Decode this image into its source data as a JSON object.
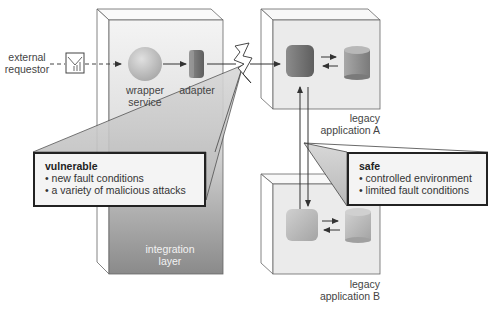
{
  "diagram": {
    "external_requestor": "external\nrequestor",
    "external_requestor_lines": [
      "external",
      "requestor"
    ],
    "wrapper_service_lines": [
      "wrapper",
      "service"
    ],
    "adapter": "adapter",
    "integration_layer_lines": [
      "integration",
      "layer"
    ],
    "legacy_a_lines": [
      "legacy",
      "application A"
    ],
    "legacy_b_lines": [
      "legacy",
      "application B"
    ],
    "vulnerable_callout": {
      "title": "vulnerable",
      "items": [
        "new fault conditions",
        "a variety of malicious attacks"
      ]
    },
    "safe_callout": {
      "title": "safe",
      "items": [
        "controlled environment",
        "limited fault conditions"
      ]
    },
    "icons": {
      "requestor": "envelope-icon",
      "attack": "lightning-bolt-icon",
      "wrapper": "sphere-icon",
      "adapter": "cylinder-block-icon",
      "app": "rounded-cube-icon",
      "database": "database-cylinder-icon"
    },
    "colors": {
      "integration_top": "#f2f2f2",
      "integration_bottom": "#8c8c8c",
      "box_face": "#ebebeb",
      "callout_wedge": "#c8c8c8",
      "app_a_component": "#7a7a7a",
      "app_b_component": "#b5b5b5"
    }
  }
}
